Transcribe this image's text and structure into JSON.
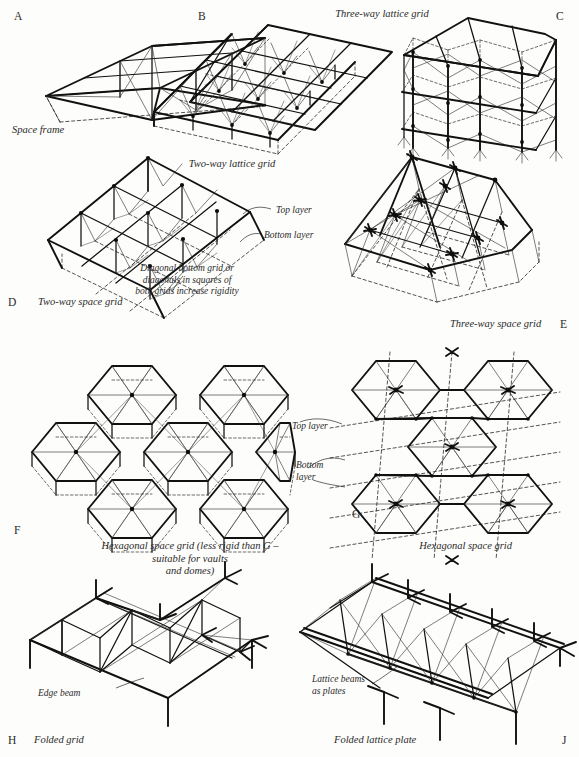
{
  "figure": {
    "background_color": "#fdfdfb",
    "ink_color": "#111111"
  },
  "panels": [
    {
      "id": "A",
      "letter": "A",
      "caption": "Space frame",
      "letter_pos": {
        "x": 14,
        "y": 10
      },
      "caption_pos": {
        "x": 12,
        "y": 124
      },
      "caption_align": "left",
      "description": "Single-bay rectangular space frame with diagonal bracing, three bays long"
    },
    {
      "id": "B",
      "letter": "B",
      "caption": "Two-way lattice grid",
      "letter_pos": {
        "x": 198,
        "y": 10
      },
      "caption_pos": {
        "x": 232,
        "y": 158
      },
      "caption_align": "center",
      "description": "Flat two-way lattice grid slab, 3 by 3 bays, isometric"
    },
    {
      "id": "C",
      "letter": "C",
      "caption": "Three-way lattice grid",
      "letter_pos": {
        "x": 556,
        "y": 10
      },
      "caption_pos": {
        "x": 382,
        "y": 8
      },
      "caption_align": "center",
      "description": "Three-way lattice grid shown as a framed structure with columns"
    },
    {
      "id": "D",
      "letter": "D",
      "caption": "Two-way space grid",
      "letter_pos": {
        "x": 8,
        "y": 296
      },
      "caption_pos": {
        "x": 38,
        "y": 296
      },
      "caption_align": "left",
      "description": "Two-layer two-way space grid, top layer squares over offset bottom layer"
    },
    {
      "id": "E",
      "letter": "E",
      "caption": "Three-way space grid",
      "letter_pos": {
        "x": 560,
        "y": 318
      },
      "caption_pos": {
        "x": 450,
        "y": 318
      },
      "caption_align": "left",
      "description": "Two-layer three-way (triangulated) space grid in isometric view"
    },
    {
      "id": "F",
      "letter": "F",
      "caption": "Hexagonal space grid (less rigid than G –\nsuitable for vaults\nand domes)",
      "letter_pos": {
        "x": 14,
        "y": 524
      },
      "caption_pos": {
        "x": 190,
        "y": 540
      },
      "caption_align": "center",
      "description": "Hexagonal (honeycomb) space grid cluster of seven hexagons with internal triangulation"
    },
    {
      "id": "G",
      "letter": "G",
      "caption": "Hexagonal space grid",
      "letter_pos": {
        "x": 352,
        "y": 508
      },
      "caption_pos": {
        "x": 512,
        "y": 540
      },
      "caption_align": "right",
      "description": "Hexagonal space grid with offset top and bottom layers"
    },
    {
      "id": "H",
      "letter": "H",
      "caption": "Folded grid",
      "letter_pos": {
        "x": 8,
        "y": 734
      },
      "caption_pos": {
        "x": 34,
        "y": 734
      },
      "caption_align": "left",
      "description": "Folded plate grid of triangulated bars forming a corrugated roof"
    },
    {
      "id": "J",
      "letter": "J",
      "caption": "Folded lattice plate",
      "letter_pos": {
        "x": 562,
        "y": 734
      },
      "caption_pos": {
        "x": 334,
        "y": 734
      },
      "caption_align": "left",
      "description": "Folded lattice plate formed of lattice beams acting as plates"
    }
  ],
  "annotations": [
    {
      "id": "d-top-layer",
      "text": "Top layer",
      "x": 276,
      "y": 205,
      "align": "left",
      "panel": "D"
    },
    {
      "id": "d-bottom-layer",
      "text": "Bottom layer",
      "x": 264,
      "y": 230,
      "align": "left",
      "panel": "D"
    },
    {
      "id": "d-diagonal-note",
      "text": "Diagonal bottom grid or\ndiagonals in squares of\nboth grids increase rigidity",
      "x": 187,
      "y": 263,
      "align": "center",
      "panel": "D"
    },
    {
      "id": "g-top-layer",
      "text": "Top layer",
      "x": 292,
      "y": 421,
      "align": "left",
      "panel": "G"
    },
    {
      "id": "g-bottom-layer",
      "text": "Bottom\nlayer",
      "x": 296,
      "y": 466,
      "align": "left",
      "panel": "G"
    },
    {
      "id": "h-edge-beam",
      "text": "Edge beam",
      "x": 38,
      "y": 692,
      "align": "left",
      "panel": "H"
    },
    {
      "id": "j-lattice-beams",
      "text": "Lattice beams\nas plates",
      "x": 312,
      "y": 679,
      "align": "left",
      "panel": "J"
    }
  ]
}
